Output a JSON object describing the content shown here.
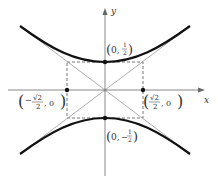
{
  "diagram": {
    "axes": {
      "x_label": "x",
      "y_label": "y"
    },
    "points": [
      {
        "id": "top-vertex",
        "label_main": "0,",
        "label_num": "1",
        "label_den": "2",
        "sign": ""
      },
      {
        "id": "bottom-vertex",
        "label_main": "0,",
        "label_num": "1",
        "label_den": "2",
        "sign": "−"
      },
      {
        "id": "left-point",
        "label_num": "√2",
        "label_den": "2",
        "label_tail": ", 0",
        "sign": "−"
      },
      {
        "id": "right-point",
        "label_num": "√2",
        "label_den": "2",
        "label_tail": ", 0",
        "sign": ""
      }
    ],
    "colors": {
      "curve": "#111111",
      "axis": "#888888",
      "dashed": "#555555",
      "asymptote": "#999999"
    }
  }
}
